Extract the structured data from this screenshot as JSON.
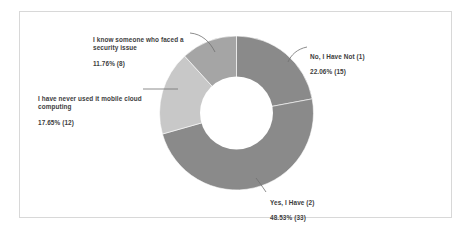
{
  "chart_data": {
    "type": "pie",
    "variant": "donut",
    "title": "",
    "subtitle": "",
    "xlabel": "",
    "ylabel": "",
    "grid": false,
    "legend_position": "callout-labels",
    "total_responses": 68,
    "start_angle_deg": 0,
    "direction": "clockwise",
    "categories": [
      "No, I Have Not (1)",
      "Yes, I Have (2)",
      "I have never used it mobile cloud computing",
      "I know someone who faced a security issue"
    ],
    "values": [
      22.06,
      48.53,
      17.65,
      11.76
    ],
    "counts": [
      15,
      33,
      12,
      8
    ],
    "colors": [
      "#8a8a8a",
      "#8a8a8a",
      "#c8c8c8",
      "#a5a5a5"
    ],
    "slices": [
      {
        "label": "No, I Have Not (1)",
        "percent": 22.06,
        "count": 15,
        "percent_text": "22.06% (15)",
        "color": "#8a8a8a"
      },
      {
        "label": "Yes, I Have (2)",
        "percent": 48.53,
        "count": 33,
        "percent_text": "48.53% (33)",
        "color": "#8a8a8a"
      },
      {
        "label": "I have never used it mobile cloud computing",
        "percent": 17.65,
        "count": 12,
        "percent_text": "17.65% (12)",
        "color": "#c8c8c8"
      },
      {
        "label": "I know someone who faced a security issue",
        "percent": 11.76,
        "count": 8,
        "percent_text": "11.76% (8)",
        "color": "#a5a5a5"
      }
    ]
  },
  "callouts": {
    "no_have_not": {
      "label": "No, I Have Not (1)",
      "percent_text": "22.06% (15)"
    },
    "yes_have": {
      "label": "Yes, I Have (2)",
      "percent_text": "48.53% (33)"
    },
    "never_used": {
      "label": "I have never used it mobile cloud computing",
      "percent_text": "17.65% (12)"
    },
    "know_someone": {
      "label": "I know someone who faced a security issue",
      "percent_text": "11.76% (8)"
    }
  },
  "style": {
    "frame_border_color": "#d8d8d8",
    "background_color": "#ffffff",
    "text_color": "#3d3d3d",
    "leader_line_color": "#707070"
  }
}
